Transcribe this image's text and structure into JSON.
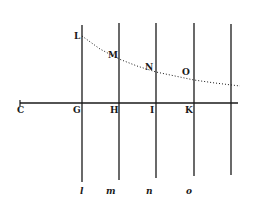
{
  "diagram": {
    "type": "geometric-figure",
    "colors": {
      "ink": "#1a1a1a",
      "background": "#ffffff"
    },
    "axis": {
      "y": 103,
      "x_start": 20,
      "x_end": 238,
      "end_tick_label": "C"
    },
    "verticals": [
      {
        "id": "G",
        "x": 82,
        "y_top": 25,
        "y_bottom": 182
      },
      {
        "id": "H",
        "x": 119,
        "y_top": 23,
        "y_bottom": 180
      },
      {
        "id": "I",
        "x": 156,
        "y_top": 23,
        "y_bottom": 178
      },
      {
        "id": "K",
        "x": 194,
        "y_top": 23,
        "y_bottom": 176
      },
      {
        "id": "end",
        "x": 231,
        "y_top": 24,
        "y_bottom": 175
      }
    ],
    "curve_points": [
      [
        82,
        36
      ],
      [
        100,
        49
      ],
      [
        119,
        59
      ],
      [
        137,
        66
      ],
      [
        156,
        72
      ],
      [
        175,
        76
      ],
      [
        194,
        80
      ],
      [
        215,
        83
      ],
      [
        240,
        86
      ]
    ],
    "labels": {
      "axis": [
        {
          "text": "C",
          "x": 17,
          "y": 113
        },
        {
          "text": "G",
          "x": 73,
          "y": 113
        },
        {
          "text": "H",
          "x": 110,
          "y": 113
        },
        {
          "text": "I",
          "x": 150,
          "y": 113
        },
        {
          "text": "K",
          "x": 185,
          "y": 113
        }
      ],
      "curve": [
        {
          "text": "L",
          "x": 74,
          "y": 39
        },
        {
          "text": "M",
          "x": 108,
          "y": 58
        },
        {
          "text": "N",
          "x": 145,
          "y": 70
        },
        {
          "text": "O",
          "x": 182,
          "y": 75
        }
      ],
      "bottom": [
        {
          "text": "l",
          "x": 80,
          "y": 194
        },
        {
          "text": "m",
          "x": 106,
          "y": 194
        },
        {
          "text": "n",
          "x": 146,
          "y": 194
        },
        {
          "text": "o",
          "x": 186,
          "y": 194
        }
      ]
    }
  }
}
